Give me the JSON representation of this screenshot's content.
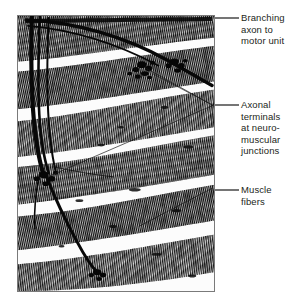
{
  "figure": {
    "type": "light-micrograph",
    "panel": {
      "border_color": "#7a7a7a",
      "background_color": "#ffffff",
      "tissue_dark_color": "#111111",
      "tissue_mid_color": "#4a4a4a"
    }
  },
  "callouts": [
    {
      "id": "branching-axon",
      "label": "Branching\naxon to\nmotor unit",
      "lines": [
        "Branching",
        "axon to",
        "motor unit"
      ],
      "leader": {
        "x1": 215,
        "y1": 18,
        "x2": 239,
        "y2": 18
      }
    },
    {
      "id": "axonal-terminals",
      "label": "Axonal\nterminals\nat neuro-\nmuscular\njunctions",
      "lines": [
        "Axonal",
        "terminals",
        "at neuro-",
        "muscular",
        "junctions"
      ],
      "leader": {
        "x1": 215,
        "y1": 105,
        "x2": 239,
        "y2": 105
      }
    },
    {
      "id": "muscle-fibers",
      "label": "Muscle\nfibers",
      "lines": [
        "Muscle",
        "fibers"
      ],
      "leader": {
        "x1": 215,
        "y1": 190,
        "x2": 239,
        "y2": 190
      }
    }
  ],
  "colors": {
    "text": "#231f20",
    "leader_line": "#333333",
    "panel_border": "#7a7a7a"
  }
}
